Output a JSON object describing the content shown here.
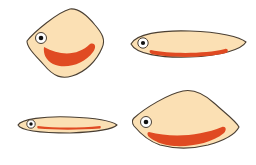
{
  "colors": {
    "background": "#ffffff",
    "body_fill": "#fbe0b4",
    "body_stroke": "#4a3f33",
    "mouth": "#e04a22",
    "eye_white": "#ffffff",
    "pupil": "#111111"
  },
  "fish": [
    {
      "id": "fish-rounded-diamond",
      "body_path": "M27,41 C34,32 58,12 70,9 C78,8 86,14 95,25 C102,33 106,40 102,48 C97,60 86,72 72,76 C62,79 54,77 44,65 C36,56 27,48 27,41 Z",
      "eye": {
        "cx": 41,
        "cy": 38,
        "r": 5.5,
        "pupil_r": 2.3
      },
      "mouth_path": "M44,47 C60,56 78,56 90,44 C95,42 97,47 93,52 C84,64 66,70 53,64 C46,60 43,54 44,47 Z"
    },
    {
      "id": "fish-long-ellipse",
      "body_path": "M131,44 C136,34 160,30 190,31 C220,32 240,37 246,42 C242,49 222,56 190,57 C160,58 136,54 131,44 Z",
      "eye": {
        "cx": 143,
        "cy": 43,
        "r": 5.2,
        "pupil_r": 2.1
      },
      "mouth_path": "M151,50 C170,54 205,54 225,49 C228,48 229,52 226,53 C205,58 170,58 152,54 C149,53 149,50 151,50 Z"
    },
    {
      "id": "fish-thin-ellipse",
      "body_path": "M18,125 C21,119 45,116 70,117 C95,118 112,121 117,125 C113,129 95,132 70,133 C45,133 21,131 18,125 Z",
      "eye": {
        "cx": 31,
        "cy": 124,
        "r": 4.2,
        "pupil_r": 1.7
      },
      "mouth_path": "M38,126 C55,128 80,128 100,126 C101,126 101,128 100,128.5 C80,130 55,130 38,128.5 C37,128 37,126 38,126 Z"
    },
    {
      "id": "fish-wide-diamond",
      "body_path": "M134,118 C145,108 168,94 183,91 C193,89 203,93 214,103 C225,113 236,121 239,127 C236,133 226,140 208,145 C192,149 175,149 160,145 C148,141 139,132 134,126 C132,123 132,120 134,118 Z",
      "eye": {
        "cx": 146,
        "cy": 122,
        "r": 5.5,
        "pupil_r": 2.3
      },
      "mouth_path": "M149,132 C172,138 200,136 222,127 C226,126 227,130 224,133 C212,143 192,147 174,146 C162,145 154,141 149,137 C147,135 147,132 149,132 Z"
    }
  ]
}
